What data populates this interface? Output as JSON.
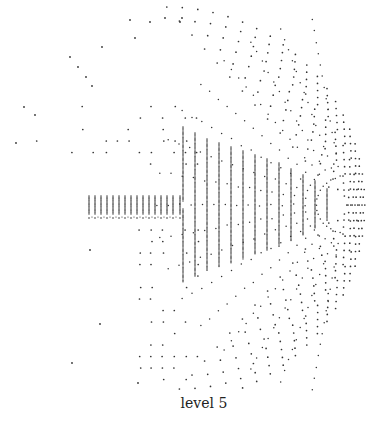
{
  "figure": {
    "caption": "level 5",
    "dot_color": "#333333",
    "background": "#ffffff"
  },
  "chart_data": {
    "type": "scatter",
    "title": "level 5",
    "grid": false,
    "legend": "none",
    "band": {
      "y_center": 205,
      "columns_x": [
        89,
        95,
        101,
        107,
        113,
        119,
        125,
        131,
        137,
        143,
        149,
        155,
        161,
        167,
        173,
        180
      ],
      "column_half_height": 9,
      "tall_columns_x": [
        183,
        195,
        207,
        219,
        231,
        243,
        255,
        267,
        279,
        291,
        303,
        315,
        327
      ],
      "tall_half_heights": [
        78,
        72,
        66,
        62,
        58,
        54,
        50,
        46,
        42,
        36,
        30,
        24,
        16
      ]
    },
    "arcs": {
      "center": [
        345,
        205
      ],
      "radii": [
        18,
        30,
        44,
        58,
        72,
        86,
        100,
        114,
        128,
        142,
        156,
        170,
        184,
        198
      ]
    },
    "sparse_grid": {
      "spacing": 11.5,
      "x_range": [
        20,
        200
      ],
      "y_range": [
        20,
        390
      ]
    }
  }
}
